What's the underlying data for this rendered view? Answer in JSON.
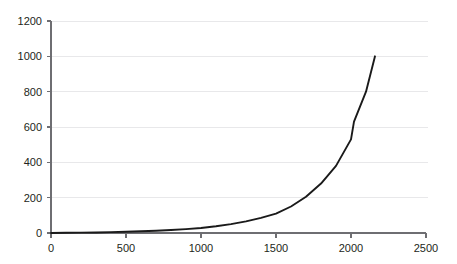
{
  "chart_data": {
    "type": "line",
    "title": "",
    "subtitle": "",
    "xlabel": "",
    "ylabel": "",
    "xlim": [
      0,
      2500
    ],
    "ylim": [
      0,
      1200
    ],
    "grid": true,
    "legend": null,
    "x_ticks": [
      0,
      500,
      1000,
      1500,
      2000,
      2500
    ],
    "x_tick_labels": [
      "0",
      "500",
      "1000",
      "1500",
      "2000",
      "2500"
    ],
    "y_ticks": [
      0,
      200,
      400,
      600,
      800,
      1000,
      1200
    ],
    "y_tick_labels": [
      "0",
      "200",
      "400",
      "600",
      "800",
      "1000",
      "1200"
    ],
    "series": [
      {
        "name": "curve",
        "color": "#1a1a1a",
        "x": [
          0,
          100,
          200,
          300,
          400,
          500,
          600,
          700,
          800,
          900,
          1000,
          1100,
          1200,
          1300,
          1400,
          1500,
          1600,
          1700,
          1800,
          1900,
          2000,
          2020,
          2100,
          2160
        ],
        "y": [
          0,
          1,
          2,
          3,
          5,
          7,
          10,
          13,
          17,
          22,
          28,
          38,
          50,
          66,
          86,
          110,
          150,
          205,
          280,
          380,
          530,
          630,
          800,
          1000
        ]
      }
    ]
  },
  "plot_geometry": {
    "x_origin_px": 51,
    "y_zero_px": 233,
    "x_max_px": 426,
    "y_top_px": 21,
    "grid_right_px": 428
  }
}
